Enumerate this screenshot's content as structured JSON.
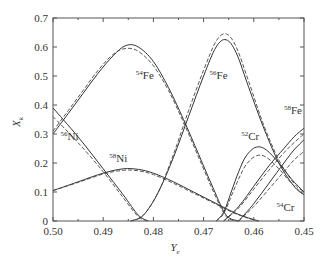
{
  "chart_data": {
    "type": "line",
    "title": "",
    "xlabel": "Ye",
    "xlabel_sub": "e",
    "ylabel": "X",
    "ylabel_sub": "k",
    "xlim": [
      0.5,
      0.45
    ],
    "ylim": [
      0,
      0.7
    ],
    "x_reversed": true,
    "grid": false,
    "x_ticks": [
      0.5,
      0.49,
      0.48,
      0.47,
      0.46,
      0.45
    ],
    "x_tick_labels": [
      "0.50",
      "0.49",
      "0.48",
      "0.47",
      "0.46",
      "0.45"
    ],
    "y_ticks": [
      0,
      0.1,
      0.2,
      0.3,
      0.4,
      0.5,
      0.6,
      0.7
    ],
    "y_tick_labels": [
      "0",
      "0.1",
      "0.2",
      "0.3",
      "0.4",
      "0.5",
      "0.6",
      "0.7"
    ],
    "series": [
      {
        "name": "56Ni",
        "mass": "56",
        "element": "Ni",
        "style": "solid",
        "x": [
          0.5,
          0.495,
          0.49,
          0.486,
          0.483,
          0.481
        ],
        "y": [
          0.39,
          0.29,
          0.18,
          0.09,
          0.02,
          0.0
        ]
      },
      {
        "name": "56Ni",
        "mass": "56",
        "element": "Ni",
        "style": "dashed",
        "x": [
          0.5,
          0.495,
          0.49,
          0.486,
          0.483,
          0.481
        ],
        "y": [
          0.36,
          0.27,
          0.17,
          0.08,
          0.015,
          0.0
        ]
      },
      {
        "name": "54Fe",
        "mass": "54",
        "element": "Fe",
        "style": "solid",
        "x": [
          0.5,
          0.497,
          0.494,
          0.491,
          0.488,
          0.4855,
          0.483,
          0.48,
          0.477,
          0.474,
          0.471,
          0.468,
          0.4655,
          0.463
        ],
        "y": [
          0.3,
          0.37,
          0.44,
          0.51,
          0.57,
          0.605,
          0.6,
          0.55,
          0.46,
          0.35,
          0.23,
          0.11,
          0.02,
          0.0
        ]
      },
      {
        "name": "54Fe",
        "mass": "54",
        "element": "Fe",
        "style": "dashed",
        "x": [
          0.5,
          0.497,
          0.494,
          0.491,
          0.488,
          0.4855,
          0.483,
          0.48,
          0.477,
          0.474,
          0.471,
          0.468,
          0.4655,
          0.463
        ],
        "y": [
          0.31,
          0.38,
          0.45,
          0.52,
          0.575,
          0.595,
          0.585,
          0.535,
          0.45,
          0.34,
          0.22,
          0.1,
          0.015,
          0.0
        ]
      },
      {
        "name": "58Ni",
        "mass": "58",
        "element": "Ni",
        "style": "solid",
        "x": [
          0.5,
          0.495,
          0.49,
          0.486,
          0.483,
          0.48,
          0.476,
          0.472,
          0.468,
          0.464,
          0.461,
          0.459
        ],
        "y": [
          0.105,
          0.135,
          0.165,
          0.18,
          0.178,
          0.165,
          0.135,
          0.1,
          0.065,
          0.03,
          0.01,
          0.0
        ]
      },
      {
        "name": "58Ni",
        "mass": "58",
        "element": "Ni",
        "style": "dashed",
        "x": [
          0.5,
          0.495,
          0.49,
          0.486,
          0.483,
          0.48,
          0.476,
          0.472,
          0.468,
          0.464,
          0.461,
          0.459
        ],
        "y": [
          0.105,
          0.133,
          0.162,
          0.175,
          0.173,
          0.16,
          0.13,
          0.096,
          0.062,
          0.028,
          0.009,
          0.0
        ]
      },
      {
        "name": "56Fe",
        "mass": "56",
        "element": "Fe",
        "style": "solid",
        "x": [
          0.4845,
          0.482,
          0.479,
          0.476,
          0.473,
          0.47,
          0.4675,
          0.4655,
          0.4635,
          0.461,
          0.458,
          0.455,
          0.452,
          0.45
        ],
        "y": [
          0.0,
          0.02,
          0.1,
          0.22,
          0.36,
          0.5,
          0.6,
          0.625,
          0.58,
          0.46,
          0.32,
          0.2,
          0.12,
          0.09
        ]
      },
      {
        "name": "56Fe",
        "mass": "56",
        "element": "Fe",
        "style": "dashed",
        "x": [
          0.4845,
          0.482,
          0.479,
          0.476,
          0.473,
          0.47,
          0.4675,
          0.4655,
          0.4635,
          0.461,
          0.458,
          0.455,
          0.452,
          0.45
        ],
        "y": [
          0.0,
          0.02,
          0.1,
          0.23,
          0.38,
          0.52,
          0.62,
          0.645,
          0.6,
          0.48,
          0.33,
          0.21,
          0.13,
          0.1
        ]
      },
      {
        "name": "52Cr",
        "mass": "52",
        "element": "Cr",
        "style": "solid",
        "x": [
          0.4675,
          0.466,
          0.4645,
          0.463,
          0.4615,
          0.4595,
          0.4575,
          0.455,
          0.4525,
          0.45
        ],
        "y": [
          0.0,
          0.03,
          0.1,
          0.17,
          0.225,
          0.255,
          0.245,
          0.2,
          0.145,
          0.1
        ]
      },
      {
        "name": "52Cr",
        "mass": "52",
        "element": "Cr",
        "style": "dashed",
        "x": [
          0.4675,
          0.466,
          0.4645,
          0.463,
          0.4615,
          0.4595,
          0.4575,
          0.455,
          0.4525,
          0.45
        ],
        "y": [
          0.0,
          0.025,
          0.085,
          0.145,
          0.195,
          0.225,
          0.22,
          0.18,
          0.13,
          0.09
        ]
      },
      {
        "name": "58Fe",
        "mass": "58",
        "element": "Fe",
        "style": "solid",
        "x": [
          0.466,
          0.463,
          0.46,
          0.457,
          0.454,
          0.452,
          0.45
        ],
        "y": [
          0.0,
          0.05,
          0.12,
          0.19,
          0.25,
          0.29,
          0.32
        ]
      },
      {
        "name": "58Fe",
        "mass": "58",
        "element": "Fe",
        "style": "dashed",
        "x": [
          0.466,
          0.463,
          0.46,
          0.457,
          0.454,
          0.452,
          0.45
        ],
        "y": [
          0.0,
          0.045,
          0.11,
          0.175,
          0.235,
          0.27,
          0.3
        ]
      },
      {
        "name": "54Cr",
        "mass": "54",
        "element": "Cr",
        "style": "solid",
        "x": [
          0.463,
          0.46,
          0.457,
          0.454,
          0.452,
          0.45
        ],
        "y": [
          0.0,
          0.06,
          0.13,
          0.2,
          0.245,
          0.28
        ]
      },
      {
        "name": "54Cr",
        "mass": "54",
        "element": "Cr",
        "style": "dashed",
        "x": [
          0.463,
          0.46,
          0.457,
          0.454,
          0.452,
          0.45
        ],
        "y": [
          0.0,
          0.05,
          0.11,
          0.17,
          0.21,
          0.24
        ]
      }
    ],
    "annotations": [
      {
        "mass": "56",
        "element": "Ni",
        "x": 0.4985,
        "y": 0.28
      },
      {
        "mass": "54",
        "element": "Fe",
        "x": 0.4835,
        "y": 0.49
      },
      {
        "mass": "58",
        "element": "Ni",
        "x": 0.4888,
        "y": 0.205
      },
      {
        "mass": "56",
        "element": "Fe",
        "x": 0.4688,
        "y": 0.49
      },
      {
        "mass": "52",
        "element": "Cr",
        "x": 0.4625,
        "y": 0.28
      },
      {
        "mass": "58",
        "element": "Fe",
        "x": 0.454,
        "y": 0.37
      },
      {
        "mass": "54",
        "element": "Cr",
        "x": 0.4555,
        "y": 0.035
      }
    ]
  }
}
